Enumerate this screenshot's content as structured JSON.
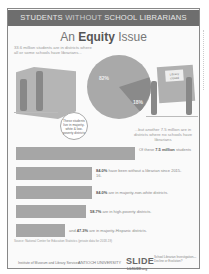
{
  "header": {
    "prefix": "STUDENTS ",
    "highlight": "WITHOUT",
    "suffix": " SCHOOL LIBRARIANS"
  },
  "title": {
    "before": "An ",
    "bold": "Equity",
    "after": " Issue"
  },
  "intro": "33.6 million students are in districts where all or some schools have librarians...",
  "pie": {
    "slices": [
      {
        "label": "82%",
        "value": 82,
        "color": "#a9a9a9"
      },
      {
        "label": "18%",
        "value": 18,
        "color": "#8a8a8a"
      }
    ]
  },
  "bubble": "These students live in majority-white & low-poverty districts",
  "sign": "Library closed",
  "another": "...but another 7.5 million are in districts where no schools have librarians",
  "stats": [
    {
      "bold": "",
      "prefix": "Of these ",
      "boldmid": "7.5 million",
      "text": " students",
      "bar_width": 119
    },
    {
      "bold": "84.0%",
      "prefix": "",
      "boldmid": "",
      "text": " have been without a librarian since 2015-16.",
      "bar_width": 76
    },
    {
      "bold": "84.0%",
      "prefix": "",
      "boldmid": "",
      "text": " are in majority-non-white districts.",
      "bar_width": 76
    },
    {
      "bold": "58.7%",
      "prefix": "",
      "boldmid": "",
      "text": " are in high-poverty districts.",
      "bar_width": 70
    },
    {
      "bold": "47.3%",
      "prefix": "and ",
      "boldmid": "",
      "text": " are in majority-Hispanic districts.",
      "bar_width": 49
    }
  ],
  "source": "Source: National Center for Education Statistics (private data for 2018-19)",
  "logos": {
    "left": "Institute of Museum and Library Services",
    "middle": "ANTIOCH UNIVERSITY",
    "slide": "SLIDE",
    "slide_sub": "School Librarian Investigation—Decline or Evolution?",
    "slide_url": "LibSLIDE.org"
  },
  "colors": {
    "header_bg": "#6e6e6e",
    "bar": "#a6a6a6",
    "frame": "#888888"
  }
}
